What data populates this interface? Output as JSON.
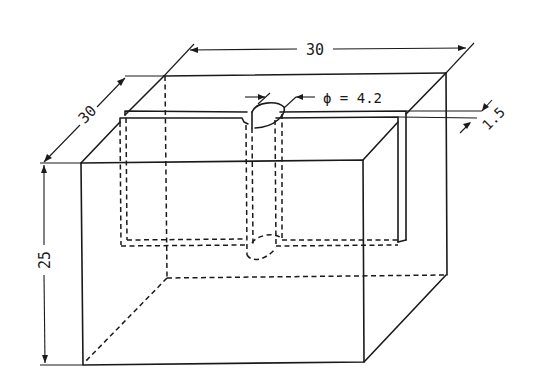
{
  "figure": {
    "type": "isometric technical drawing",
    "line_color": "#1a1a1a",
    "background": "#ffffff"
  },
  "dimensions": {
    "width_top": {
      "label": "30",
      "meaning": "width"
    },
    "depth": {
      "label": "30",
      "meaning": "depth"
    },
    "height": {
      "label": "25",
      "meaning": "height"
    },
    "hole_diameter": {
      "label": "ϕ = 4.2",
      "symbol": "ϕ",
      "value": "4.2"
    },
    "slot_width": {
      "label": "1.5"
    }
  }
}
